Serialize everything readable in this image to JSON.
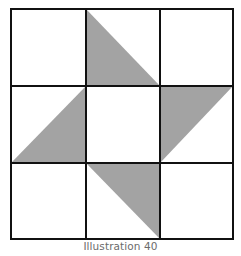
{
  "figure": {
    "caption": "Illustration 40",
    "grid": {
      "rows": 3,
      "cols": 3,
      "xs": [
        11,
        86,
        160,
        233
      ],
      "ys": [
        9,
        86,
        163,
        239
      ]
    },
    "colors": {
      "fill": "#a3a3a3",
      "line": "#111111",
      "background": "#ffffff",
      "caption": "#6b6b6b"
    },
    "triangles": [
      {
        "cell": "top-middle",
        "points": "86,9 86,86 160,86"
      },
      {
        "cell": "middle-left",
        "points": "86,86 86,163 11,163"
      },
      {
        "cell": "middle-right",
        "points": "160,86 233,86 160,163"
      },
      {
        "cell": "bottom-middle",
        "points": "86,163 160,163 160,239"
      }
    ]
  }
}
